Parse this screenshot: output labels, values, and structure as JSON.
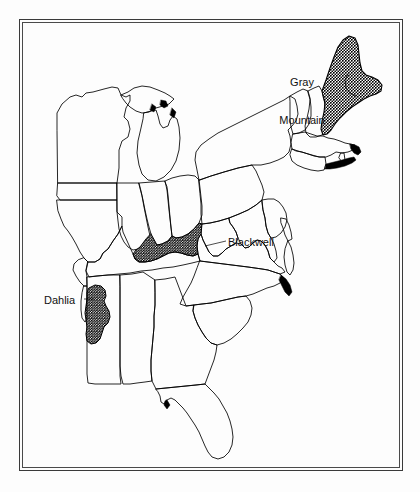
{
  "figure": {
    "kind": "distribution-map",
    "region": "Eastern United States",
    "background_color": "#fdfdfd",
    "outline_color": "#000000",
    "frame": {
      "style": "double-line",
      "color": "#3a3a3a"
    }
  },
  "labels": [
    {
      "id": "gray-mountain",
      "text": "Gray\nMountain",
      "line1": "Gray",
      "line2": "Mountain",
      "x": 302,
      "y": 63,
      "align": "center"
    },
    {
      "id": "blackwell",
      "text": "Blackwell",
      "x": 228,
      "y": 242,
      "align": "left"
    },
    {
      "id": "dahlia",
      "text": "Dahlia",
      "x": 44,
      "y": 300,
      "align": "left"
    }
  ],
  "shaded_regions": [
    {
      "id": "maine-region",
      "label": "Gray Mountain",
      "fill": "stipple-dense",
      "fill_color": "#000000",
      "location": "Maine"
    },
    {
      "id": "kentucky-region",
      "label": "Blackwell",
      "fill": "stipple-dense",
      "fill_color": "#000000",
      "location": "Kentucky"
    },
    {
      "id": "mississippi-region",
      "label": "Dahlia",
      "fill": "stipple-dense",
      "fill_color": "#000000",
      "location": "Mississippi / western Alabama"
    }
  ],
  "states_outlined": [
    "Maine",
    "New Hampshire",
    "Vermont",
    "Massachusetts",
    "Rhode Island",
    "Connecticut",
    "New York",
    "New Jersey",
    "Pennsylvania",
    "Delaware",
    "Maryland",
    "Virginia",
    "West Virginia",
    "North Carolina",
    "South Carolina",
    "Georgia",
    "Florida",
    "Alabama",
    "Mississippi",
    "Tennessee",
    "Kentucky",
    "Ohio",
    "Indiana",
    "Illinois",
    "Michigan",
    "Wisconsin",
    "Missouri",
    "Arkansas",
    "Louisiana",
    "Iowa"
  ]
}
